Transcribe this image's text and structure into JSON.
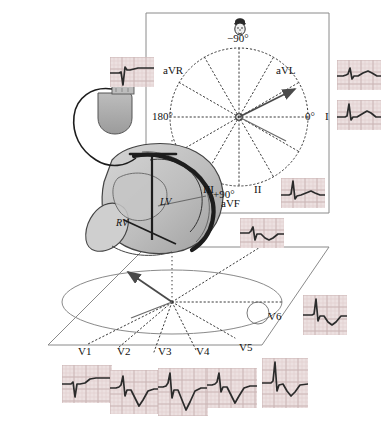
{
  "figure": {
    "background_color": "#ffffff",
    "ink_color": "#1a1a1a",
    "heart_fill": "#b8b8b8",
    "heart_fill_light": "#d0d0d0",
    "device_fill": "#a8a8a8",
    "ecg_grid_color": "#e0cfcf",
    "ecg_trace_color": "#2b2b2b"
  },
  "frontal_plane": {
    "name": "hexaxial-reference-system",
    "degree_labels": [
      {
        "id": "minus90",
        "text": "−90°",
        "x": 236,
        "y": 39
      },
      {
        "id": "zero",
        "text": "0°",
        "x": 310,
        "y": 117
      },
      {
        "id": "one80",
        "text": "180°",
        "x": 157,
        "y": 117
      },
      {
        "id": "plus90",
        "text": "+90°",
        "x": 223,
        "y": 195
      }
    ],
    "lead_labels": [
      {
        "id": "aVR",
        "text": "aVR",
        "x": 166,
        "y": 71
      },
      {
        "id": "aVL",
        "text": "aVL",
        "x": 279,
        "y": 71
      },
      {
        "id": "I",
        "text": "I",
        "x": 328,
        "y": 117
      },
      {
        "id": "II",
        "text": "II",
        "x": 258,
        "y": 190
      },
      {
        "id": "III",
        "text": "III",
        "x": 206,
        "y": 190
      },
      {
        "id": "aVF",
        "text": "aVF",
        "x": 228,
        "y": 204
      }
    ],
    "head_icon": "patient-head-icon",
    "axis_count": 12,
    "vector_arrow": {
      "label": "mean-qrs-axis",
      "angle_deg": -30
    }
  },
  "heart": {
    "name": "heart-cross-section",
    "chambers": [
      {
        "id": "LV",
        "text": "LV",
        "x": 166,
        "y": 203
      },
      {
        "id": "RV",
        "text": "RV",
        "x": 122,
        "y": 224
      }
    ]
  },
  "device": {
    "name": "pacemaker-generator",
    "lead_name": "pacing-lead-wire"
  },
  "horizontal_plane": {
    "name": "horizontal-plane-reference",
    "precordial_labels": [
      {
        "id": "V1",
        "text": "V1",
        "x": 83,
        "y": 352
      },
      {
        "id": "V2",
        "text": "V2",
        "x": 122,
        "y": 352
      },
      {
        "id": "V3",
        "text": "V3",
        "x": 163,
        "y": 352
      },
      {
        "id": "V4",
        "text": "V4",
        "x": 201,
        "y": 352
      },
      {
        "id": "V5",
        "text": "V5",
        "x": 243,
        "y": 348
      },
      {
        "id": "V6",
        "text": "V6",
        "x": 272,
        "y": 317
      }
    ],
    "vector_arrow": {
      "label": "horizontal-qrs-vector"
    }
  },
  "ecg_strips": [
    {
      "id": "aVR",
      "lead": "aVR",
      "x": 110,
      "y": 57,
      "w": 44,
      "h": 30,
      "morphology": "deep-negative-qs",
      "points": "0,16 6,16 9,16 11,15 13,28 15,10 17,13 20,13 24,12 28,11 33,11 38,11 44,11"
    },
    {
      "id": "aVL",
      "lead": "aVL",
      "x": 337,
      "y": 60,
      "w": 44,
      "h": 30,
      "morphology": "small-r-with-t",
      "points": "0,16 6,16 9,15 11,14 13,8 15,19 17,16 21,16 26,13 31,11 35,13 40,16 44,16"
    },
    {
      "id": "I",
      "lead": "I",
      "x": 337,
      "y": 100,
      "w": 44,
      "h": 30,
      "morphology": "tall-r-wave",
      "points": "0,17 5,17 8,17 10,16 12,4 14,20 16,17 20,17 25,14 30,11 34,13 39,17 44,17"
    },
    {
      "id": "II",
      "lead": "II",
      "x": 281,
      "y": 178,
      "w": 44,
      "h": 30,
      "morphology": "tall-r-wave",
      "points": "0,17 5,17 8,17 10,16 12,3 14,21 16,18 20,17 25,15 30,13 34,15 39,17 44,17"
    },
    {
      "id": "aVF",
      "lead": "aVF",
      "x": 240,
      "y": 218,
      "w": 44,
      "h": 30,
      "morphology": "rs-with-negative-t",
      "points": "0,15 6,15 9,15 11,13 13,9 15,22 17,16 21,16 25,20 29,22 33,20 38,16 44,16"
    },
    {
      "id": "V6",
      "lead": "V6",
      "x": 303,
      "y": 295,
      "w": 44,
      "h": 40,
      "morphology": "tall-r-negative-t",
      "points": "0,20 6,20 9,20 11,19 13,4 15,26 17,21 21,21 25,27 29,30 33,27 38,21 44,21"
    },
    {
      "id": "V1",
      "lead": "V1",
      "x": 62,
      "y": 365,
      "w": 50,
      "h": 38,
      "morphology": "rs-flat-t",
      "points": "0,19 6,19 9,19 11,17 13,32 15,19 18,19 23,18 28,14 34,13 41,13 50,13"
    },
    {
      "id": "V2",
      "lead": "V2",
      "x": 110,
      "y": 370,
      "w": 50,
      "h": 44,
      "morphology": "rs-deep-negative-t",
      "points": "0,18 6,18 9,17 11,15 13,6 15,26 17,20 21,20 25,28 29,36 33,30 38,21 44,19 50,19"
    },
    {
      "id": "V3",
      "lead": "V3",
      "x": 158,
      "y": 368,
      "w": 50,
      "h": 48,
      "morphology": "rs-deep-negative-t",
      "points": "0,19 5,19 8,18 10,15 12,5 14,30 16,22 20,22 24,32 28,42 32,34 37,23 43,20 50,20"
    },
    {
      "id": "V4",
      "lead": "V4",
      "x": 207,
      "y": 368,
      "w": 50,
      "h": 40,
      "morphology": "r-with-deep-negative-t",
      "points": "0,17 5,17 8,16 10,14 12,5 14,24 16,19 20,19 24,27 28,35 32,28 37,20 43,18 50,18"
    },
    {
      "id": "V5",
      "lead": "V5",
      "x": 262,
      "y": 358,
      "w": 46,
      "h": 50,
      "morphology": "tall-r-negative-t",
      "points": "0,25 6,25 9,25 11,23 13,4 15,33 17,27 21,26 25,33 29,38 33,34 38,27 46,26"
    }
  ]
}
